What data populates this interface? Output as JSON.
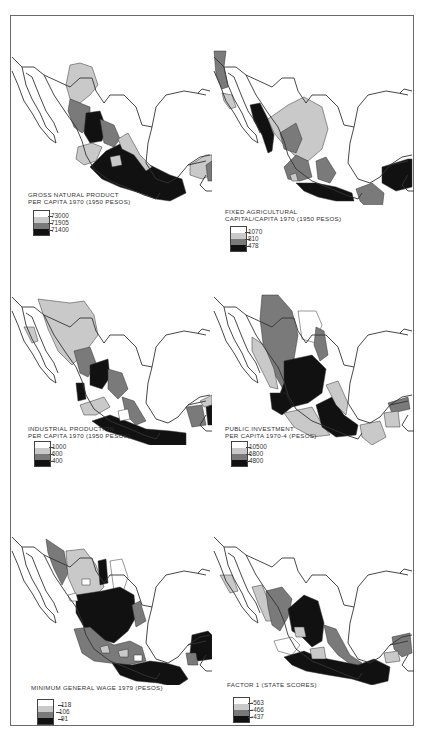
{
  "colors": {
    "class1": "#ffffff",
    "class2": "#c9c9c9",
    "class3": "#7a7a7a",
    "class4": "#111111"
  },
  "panels": [
    {
      "id": "gnp",
      "title": "GROSS NATURAL PRODUCT\nPER CAPITA 1970 (1950 PESOS)",
      "legend": [
        "73000",
        "71905",
        "71400"
      ]
    },
    {
      "id": "agcap",
      "title": "FIXED AGRICULTURAL\nCAPITAL/CAPITA 1970 (1950 PESOS)",
      "legend": [
        "1070",
        "810",
        "478"
      ]
    },
    {
      "id": "industrial",
      "title": "INDUSTRIAL PRODUCTION\nPER CAPITA 1970 (1950 PESOS)",
      "legend": [
        "1000",
        "600",
        "400"
      ]
    },
    {
      "id": "investment",
      "title": "PUBLIC INVESTMENT\nPER CAPITA 1970-4 (PESOS)",
      "legend": [
        "10500",
        "6800",
        "4800"
      ]
    },
    {
      "id": "wage",
      "title": "MINIMUM GENERAL WAGE 1979 (PESOS)",
      "legend": [
        "118",
        "106",
        "91"
      ]
    },
    {
      "id": "factor1",
      "title": "FACTOR 1 (STATE SCORES)",
      "legend": [
        "·563",
        "·466",
        "·437"
      ]
    }
  ]
}
